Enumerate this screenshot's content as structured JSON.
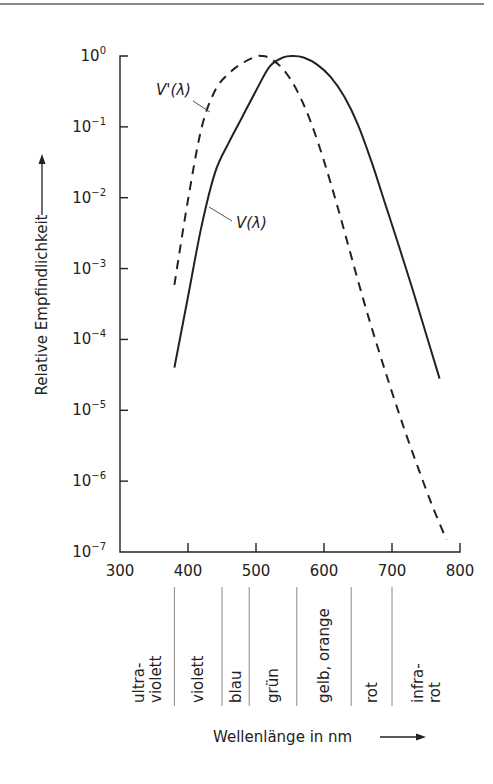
{
  "chart_data": {
    "type": "line",
    "title": "",
    "xlabel": "Wellenlänge in nm",
    "ylabel": "Relative Empfindlichkeit",
    "xscale": "linear",
    "yscale": "log",
    "xlim": [
      300,
      800
    ],
    "ylim": [
      1e-07,
      1
    ],
    "grid": false,
    "x_ticks": [
      "300",
      "400",
      "500",
      "600",
      "700",
      "800"
    ],
    "y_ticks": [
      {
        "base": "10",
        "exp": "0"
      },
      {
        "base": "10",
        "exp": "−1"
      },
      {
        "base": "10",
        "exp": "−2"
      },
      {
        "base": "10",
        "exp": "−3"
      },
      {
        "base": "10",
        "exp": "−4"
      },
      {
        "base": "10",
        "exp": "−5"
      },
      {
        "base": "10",
        "exp": "−6"
      },
      {
        "base": "10",
        "exp": "−7"
      }
    ],
    "series": [
      {
        "name": "V(λ)",
        "style": "solid",
        "x": [
          380,
          400,
          420,
          440,
          460,
          480,
          500,
          520,
          540,
          555,
          570,
          590,
          610,
          630,
          650,
          670,
          690,
          710,
          730,
          750,
          770
        ],
        "y": [
          4e-05,
          0.0004,
          0.004,
          0.023,
          0.06,
          0.139,
          0.323,
          0.71,
          0.954,
          1.0,
          0.952,
          0.757,
          0.503,
          0.265,
          0.107,
          0.032,
          0.0082,
          0.0021,
          0.00052,
          0.00012,
          2.8e-05
        ]
      },
      {
        "name": "V'(λ)",
        "style": "dashed",
        "x": [
          380,
          400,
          420,
          440,
          460,
          480,
          500,
          507,
          520,
          540,
          560,
          580,
          600,
          620,
          640,
          660,
          680,
          700,
          720,
          740,
          760,
          780
        ],
        "y": [
          0.00059,
          0.0093,
          0.097,
          0.328,
          0.567,
          0.793,
          0.982,
          1.0,
          0.935,
          0.65,
          0.329,
          0.121,
          0.033,
          0.0074,
          0.0015,
          0.00031,
          7.2e-05,
          1.8e-05,
          4.8e-06,
          1.4e-06,
          4.3e-07,
          1.5e-07
        ]
      }
    ],
    "annotations": [
      {
        "text": "V'(λ)",
        "points_to": "V'(λ)"
      },
      {
        "text": "V(λ)",
        "points_to": "V(λ)"
      }
    ],
    "spectral_bands": [
      {
        "label_lines": [
          "ultra-",
          "violett"
        ],
        "from": 300,
        "to": 380
      },
      {
        "label_lines": [
          "violett"
        ],
        "from": 380,
        "to": 450
      },
      {
        "label_lines": [
          "blau"
        ],
        "from": 450,
        "to": 490
      },
      {
        "label_lines": [
          "grün"
        ],
        "from": 490,
        "to": 560
      },
      {
        "label_lines": [
          "gelb, orange"
        ],
        "from": 560,
        "to": 640
      },
      {
        "label_lines": [
          "rot"
        ],
        "from": 640,
        "to": 700
      },
      {
        "label_lines": [
          "infra-",
          "rot"
        ],
        "from": 700,
        "to": 800
      }
    ],
    "band_dividers_nm": [
      380,
      450,
      490,
      560,
      640,
      700
    ]
  },
  "labels": {
    "ylabel": "Relative Empfindlichkeit",
    "xlabel": "Wellenlänge in nm",
    "curve_v": "V(λ)",
    "curve_vprime": "V'(λ)"
  },
  "colors": {
    "ink": "#222222",
    "divider": "#888888",
    "rule": "#8a8a8a"
  }
}
